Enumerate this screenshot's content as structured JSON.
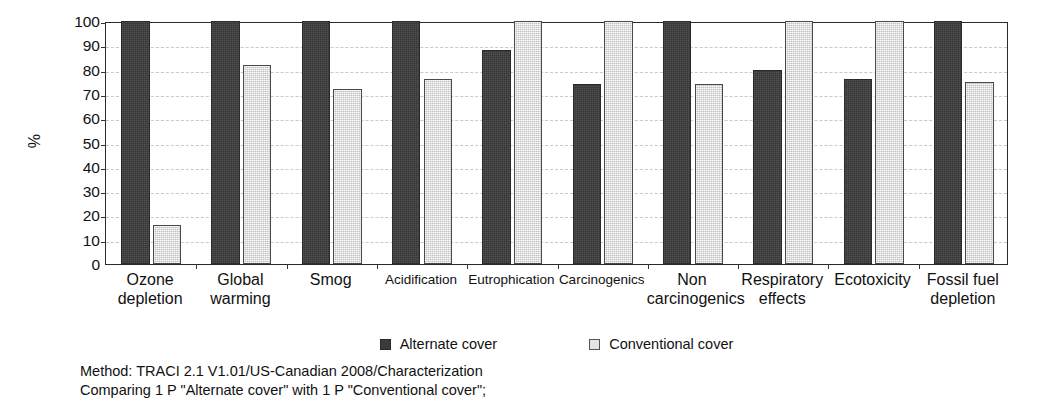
{
  "chart_data": {
    "type": "bar",
    "title": "",
    "xlabel": "",
    "ylabel": "%",
    "ylim": [
      0,
      100
    ],
    "yticks": [
      0,
      10,
      20,
      30,
      40,
      50,
      60,
      70,
      80,
      90,
      100
    ],
    "grid": true,
    "legend_position": "bottom-center",
    "categories": [
      "Ozone\ndepletion",
      "Global\nwarming",
      "Smog",
      "Acidification",
      "Eutrophication",
      "Carcinogenics",
      "Non\ncarcinogenics",
      "Respiratory\neffects",
      "Ecotoxicity",
      "Fossil fuel\ndepletion"
    ],
    "category_label_size": [
      "big",
      "big",
      "big",
      "small",
      "small",
      "small",
      "big",
      "big",
      "big",
      "big"
    ],
    "series": [
      {
        "name": "Alternate cover",
        "color": "#3b3b3b",
        "values": [
          100,
          100,
          100,
          100,
          88,
          74,
          100,
          80,
          76,
          100
        ]
      },
      {
        "name": "Conventional cover",
        "color": "#d9d9d9",
        "values": [
          16,
          82,
          72,
          76,
          100,
          100,
          74,
          100,
          100,
          75
        ]
      }
    ]
  },
  "legend": {
    "entries": [
      {
        "label": "Alternate cover",
        "marker": "filled-square"
      },
      {
        "label": "Conventional cover",
        "marker": "outlined-square"
      }
    ]
  },
  "footer": {
    "line1": "Method: TRACI 2.1 V1.01/US-Canadian 2008/Characterization",
    "line2": "Comparing 1 P \"Alternate cover\" with 1 P \"Conventional cover\";"
  }
}
